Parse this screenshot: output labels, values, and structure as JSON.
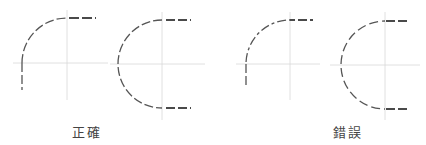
{
  "diagram": {
    "topic": "hidden line arc tangency convention",
    "colors": {
      "background": "#ffffff",
      "hidden_line": "#555555",
      "center_line": "#d8d8d8",
      "label": "#444444"
    },
    "groups": [
      {
        "id": "correct",
        "label": "正確",
        "figures": [
          "quarter-arc-correct",
          "semicircle-correct"
        ]
      },
      {
        "id": "incorrect",
        "label": "錯誤",
        "figures": [
          "quarter-arc-incorrect",
          "semicircle-incorrect"
        ]
      }
    ]
  }
}
